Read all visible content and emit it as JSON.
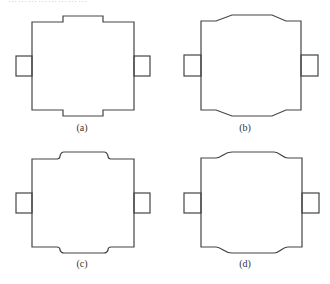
{
  "figure": {
    "panels": [
      {
        "id": "a",
        "label": "(a)",
        "shape": "rectangular-bumps"
      },
      {
        "id": "b",
        "label": "(b)",
        "shape": "tapered-bumps"
      },
      {
        "id": "c",
        "label": "(c)",
        "shape": "rounded-small-bumps"
      },
      {
        "id": "d",
        "label": "(d)",
        "shape": "curved-tapered-bumps"
      }
    ]
  },
  "header_cutoff_text": "……………………"
}
